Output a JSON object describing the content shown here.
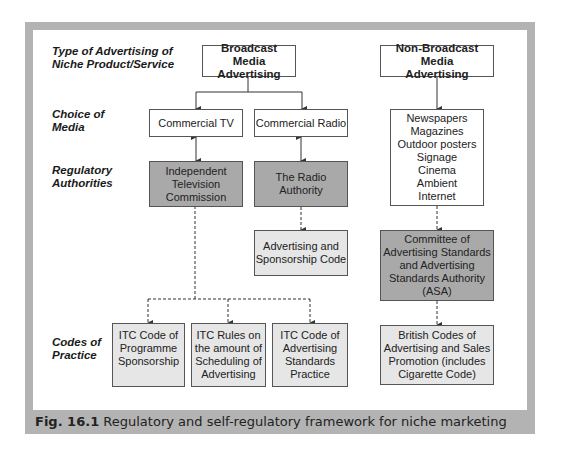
{
  "row_labels": {
    "type": "Type of Advertising of Niche Product/Service",
    "type_line1": "Type of Advertising of",
    "type_line2": "Niche Product/Service",
    "media_line1": "Choice of",
    "media_line2": "Media",
    "reg_line1": "Regulatory",
    "reg_line2": "Authorities",
    "codes_line1": "Codes of",
    "codes_line2": "Practice"
  },
  "nodes": {
    "broadcast": {
      "line1": "Broadcast Media",
      "line2": "Advertising"
    },
    "non_broadcast": {
      "line1": "Non-Broadcast Media",
      "line2": "Advertising"
    },
    "commercial_tv": "Commercial TV",
    "commercial_radio": "Commercial Radio",
    "non_broadcast_media": [
      "Newspapers",
      "Magazines",
      "Outdoor posters",
      "Signage",
      "Cinema",
      "Ambient",
      "Internet"
    ],
    "itc": [
      "Independent",
      "Television",
      "Commission"
    ],
    "radio_authority": [
      "The Radio",
      "Authority"
    ],
    "adv_sponsorship_code": [
      "Advertising and",
      "Sponsorship Code"
    ],
    "cap_asa": [
      "Committee of",
      "Advertising Standards",
      "and Advertising",
      "Standards Authority",
      "(ASA)"
    ],
    "itc_code_sponsorship": [
      "ITC Code of",
      "Programme",
      "Sponsorship"
    ],
    "itc_rules_scheduling": [
      "ITC Rules on",
      "the amount of",
      "Scheduling of",
      "Advertising"
    ],
    "itc_code_standards": [
      "ITC Code of",
      "Advertising",
      "Standards",
      "Practice"
    ],
    "british_codes": [
      "British Codes of",
      "Advertising and Sales",
      "Promotion (includes",
      "Cigarette Code)"
    ]
  },
  "caption": {
    "fig_label": "Fig. 16.1",
    "text": " Regulatory and self-regulatory framework for niche marketing"
  },
  "colors": {
    "frame": "#b3b3b3",
    "authority_fill": "#a9a9a9",
    "code_fill": "#e6e6e6"
  }
}
